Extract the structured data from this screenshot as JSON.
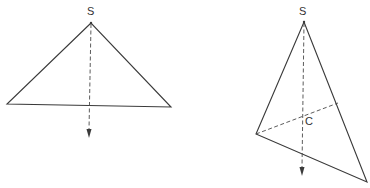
{
  "figures": [
    {
      "id": "left",
      "apex_label": "S",
      "apex": [
        91,
        23
      ],
      "vertices": [
        [
          7,
          104
        ],
        [
          171,
          107
        ]
      ],
      "plumb_line_end": [
        89,
        137
      ]
    },
    {
      "id": "right",
      "apex_label": "S",
      "center_label": "C",
      "apex": [
        304,
        22
      ],
      "vertices": [
        [
          256,
          134
        ],
        [
          367,
          182
        ]
      ],
      "median_end": [
        338,
        103
      ],
      "center": [
        302,
        115
      ],
      "plumb_line_end": [
        302,
        175
      ]
    }
  ],
  "colors": {
    "line": "#3a3a3a",
    "dashed": "#4a4a4a",
    "label": "#333333",
    "background": "#ffffff"
  }
}
